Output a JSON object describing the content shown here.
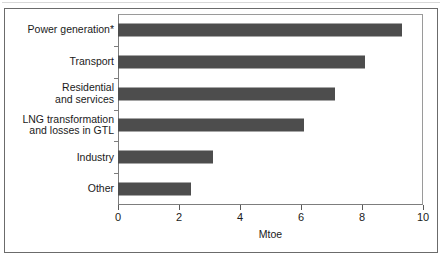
{
  "chart_data": {
    "type": "bar",
    "orientation": "horizontal",
    "title": "",
    "xlabel": "Mtoe",
    "ylabel": "",
    "xlim": [
      0,
      10
    ],
    "xticks": [
      0,
      2,
      4,
      6,
      8,
      10
    ],
    "xtick_labels": [
      "0",
      "2",
      "4",
      "6",
      "8",
      "10"
    ],
    "grid": false,
    "legend": null,
    "categories": [
      "Power generation*",
      "Transport",
      "Residential\nand services",
      "LNG transformation\nand losses in GTL",
      "Industry",
      "Other"
    ],
    "values": [
      9.3,
      8.1,
      7.1,
      6.1,
      3.1,
      2.4
    ],
    "series": [
      {
        "name": "Mtoe",
        "values": [
          9.3,
          8.1,
          7.1,
          6.1,
          3.1,
          2.4
        ]
      }
    ],
    "bar_color": "#4d4d4d",
    "axis_color": "#7d7d7d",
    "background_color": "#ffffff"
  }
}
